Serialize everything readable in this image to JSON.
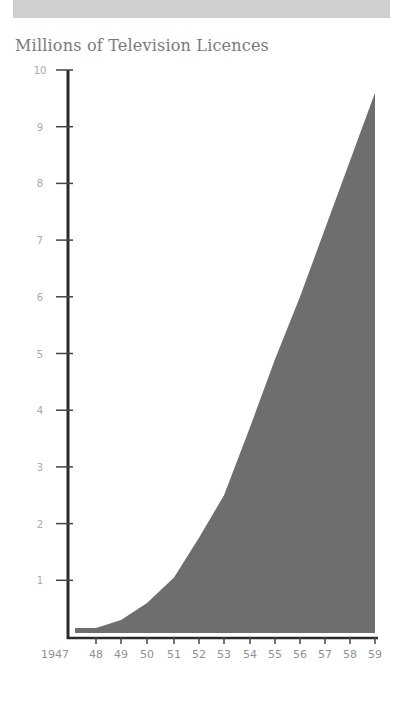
{
  "header": {
    "title": "Millions of Television Licences"
  },
  "chart_data": {
    "type": "area",
    "title": "Millions of Television Licences",
    "xlabel": "",
    "ylabel": "Millions of Television Licences",
    "categories": [
      "1947",
      "48",
      "49",
      "50",
      "51",
      "52",
      "53",
      "54",
      "55",
      "56",
      "57",
      "58",
      "59"
    ],
    "x": [
      1947,
      1948,
      1949,
      1950,
      1951,
      1952,
      1953,
      1954,
      1955,
      1956,
      1957,
      1958,
      1959
    ],
    "values": [
      0.1,
      0.15,
      0.3,
      0.6,
      1.05,
      1.75,
      2.5,
      3.7,
      4.9,
      6.0,
      7.2,
      8.4,
      9.6
    ],
    "y_ticks": [
      "1",
      "2",
      "3",
      "4",
      "5",
      "6",
      "7",
      "8",
      "9",
      "10"
    ],
    "ylim": [
      0,
      10
    ],
    "grid": false,
    "legend": null,
    "colors": {
      "fill": "#6e6e6e",
      "axis": "#2a2a2a",
      "tick_label": "#aaaaaa"
    }
  }
}
